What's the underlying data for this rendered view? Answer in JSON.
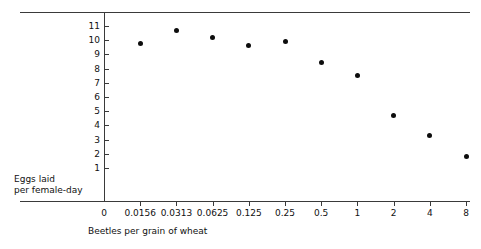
{
  "chart_data": {
    "type": "scatter",
    "title": "",
    "xlabel": "Beetles per grain of wheat",
    "ylabel_lines": [
      "Eggs laid",
      "per female-day"
    ],
    "ylabel": "Eggs laid per female-day",
    "x_tick_labels": [
      "0",
      "0.0156",
      "0.0313",
      "0.0625",
      "0.125",
      "0.25",
      "0.5",
      "1",
      "2",
      "4",
      "8"
    ],
    "x_categories": [
      "0.0156",
      "0.0313",
      "0.0625",
      "0.125",
      "0.25",
      "0.5",
      "1",
      "2",
      "4",
      "8"
    ],
    "x_numeric": [
      0.0156,
      0.0313,
      0.0625,
      0.125,
      0.25,
      0.5,
      1,
      2,
      4,
      8
    ],
    "x_scale": "log2",
    "y_tick_labels": [
      "11",
      "10",
      "9",
      "8",
      "7",
      "6",
      "5",
      "4",
      "3",
      "2",
      "1"
    ],
    "ylim": [
      0,
      11.8
    ],
    "y_ticks": [
      1,
      2,
      3,
      4,
      5,
      6,
      7,
      8,
      9,
      10,
      11
    ],
    "values": [
      9.8,
      10.7,
      10.2,
      9.6,
      9.9,
      8.4,
      7.5,
      4.7,
      3.3,
      1.8
    ],
    "points": [
      {
        "x_label": "0.0156",
        "y": 9.8
      },
      {
        "x_label": "0.0313",
        "y": 10.7
      },
      {
        "x_label": "0.0625",
        "y": 10.2
      },
      {
        "x_label": "0.125",
        "y": 9.6
      },
      {
        "x_label": "0.25",
        "y": 9.9
      },
      {
        "x_label": "0.5",
        "y": 8.4
      },
      {
        "x_label": "1",
        "y": 7.5
      },
      {
        "x_label": "2",
        "y": 4.7
      },
      {
        "x_label": "4",
        "y": 3.3
      },
      {
        "x_label": "8",
        "y": 1.8
      }
    ],
    "grid": false,
    "legend": null,
    "marker_color": "#0d0d0d",
    "axis_color": "#3a3a3a"
  }
}
